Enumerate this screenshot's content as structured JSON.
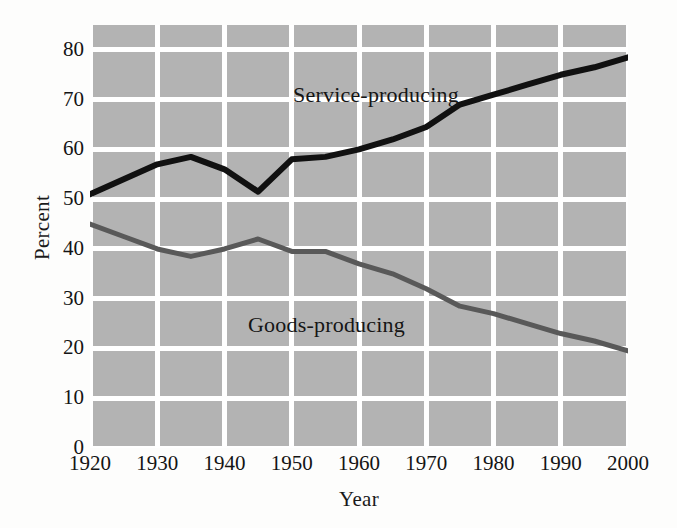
{
  "chart_data": {
    "type": "line",
    "title": "",
    "subtitle": "",
    "xlabel": "Year",
    "ylabel": "Percent",
    "xlim": [
      1920,
      2000
    ],
    "ylim": [
      0,
      85
    ],
    "grid": true,
    "legend_position": "inline-annotation",
    "plot_background": "#b3b3b3",
    "gridline_color": "#ffffff",
    "xticks": [
      "1920",
      "1930",
      "1940",
      "1950",
      "1960",
      "1970",
      "1980",
      "1990",
      "2000"
    ],
    "xtick_values": [
      1920,
      1930,
      1940,
      1950,
      1960,
      1970,
      1980,
      1990,
      2000
    ],
    "yticks": [
      "0",
      "10",
      "20",
      "30",
      "40",
      "50",
      "60",
      "70",
      "80"
    ],
    "ytick_values": [
      0,
      10,
      20,
      30,
      40,
      50,
      60,
      70,
      80
    ],
    "series": [
      {
        "name": "Service-producing",
        "color": "#111111",
        "width": 6,
        "annotation": "Service-producing",
        "x": [
          1920,
          1925,
          1930,
          1935,
          1940,
          1945,
          1950,
          1955,
          1960,
          1965,
          1970,
          1975,
          1980,
          1985,
          1990,
          1995,
          2000
        ],
        "values": [
          51,
          54,
          57,
          58.5,
          56,
          51.5,
          58,
          58.5,
          60,
          62,
          64.5,
          69,
          71,
          73,
          75,
          76.5,
          78.5
        ]
      },
      {
        "name": "Goods-producing",
        "color": "#595959",
        "width": 5,
        "annotation": "Goods-producing",
        "x": [
          1920,
          1925,
          1930,
          1935,
          1940,
          1945,
          1950,
          1955,
          1960,
          1965,
          1970,
          1975,
          1980,
          1985,
          1990,
          1995,
          2000
        ],
        "values": [
          45,
          42.5,
          40,
          38.5,
          40,
          42,
          39.5,
          39.5,
          37,
          35,
          32,
          28.5,
          27,
          25,
          23,
          21.5,
          19.5
        ]
      }
    ]
  }
}
